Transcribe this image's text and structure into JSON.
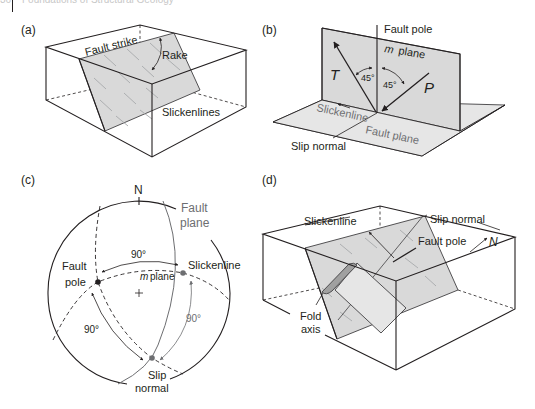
{
  "header": {
    "page_number": "36",
    "running_title": "Foundations of Structural Geology"
  },
  "panels": {
    "a": {
      "label": "(a)",
      "fault_strike": "Fault strike",
      "rake": "Rake",
      "slickenlines": "Slickenlines"
    },
    "b": {
      "label": "(b)",
      "fault_pole": "Fault pole",
      "m_plane_m": "m",
      "m_plane_word": "plane",
      "t_axis": "T",
      "p_axis": "P",
      "angle_left": "45°",
      "angle_right": "45°",
      "slickenline": "Slickenline",
      "fault_plane": "Fault plane",
      "slip_normal": "Slip normal"
    },
    "c": {
      "label": "(c)",
      "north": "N",
      "fault_plane_line1": "Fault",
      "fault_plane_line2": "plane",
      "fault_pole_line1": "Fault",
      "fault_pole_line2": "pole",
      "slickenline": "Slickenline",
      "m_plane_m": "m",
      "m_plane_word": "plane",
      "angle_top": "90°",
      "angle_left": "90°",
      "angle_right": "90°",
      "slip_normal_line1": "Slip",
      "slip_normal_line2": "normal"
    },
    "d": {
      "label": "(d)",
      "slickenline": "Slickenline",
      "slip_normal": "Slip normal",
      "fault_pole": "Fault pole",
      "north": "N",
      "fold_axis_line1": "Fold",
      "fold_axis_line2": "axis"
    }
  },
  "colors": {
    "ink": "#231f20",
    "gray_label": "#6d6e71",
    "plane_fill": "#d9d9d9",
    "fold_hinge": "#a0a0a0"
  }
}
